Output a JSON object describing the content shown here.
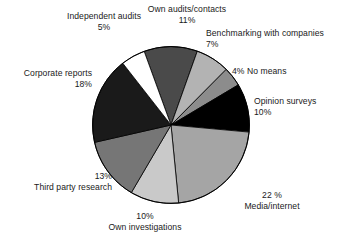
{
  "chart_data": {
    "type": "pie",
    "title": "",
    "subtitle": "",
    "legend": "none",
    "labels_position": "outside-callout",
    "categories": [
      "Own audits/contacts",
      "Benchmarking with companies",
      "No means",
      "Opinion surveys",
      "Media/internet",
      "Own investigations",
      "Third party research",
      "Corporate reports",
      "Independent audits"
    ],
    "values": [
      11,
      7,
      4,
      10,
      22,
      10,
      13,
      18,
      5
    ],
    "value_suffix": "%",
    "total": 100,
    "start_angle_deg": -20,
    "direction": "clockwise",
    "colors": [
      "#4a4a4a",
      "#b3b3b3",
      "#8c8c8c",
      "#000000",
      "#a5a5a5",
      "#c9c9c9",
      "#767676",
      "#1a1a1a",
      "#ffffff"
    ],
    "slice_border_color": "#000000"
  },
  "slices": [
    {
      "name": "Own audits/contacts",
      "label": "Own audits/contacts",
      "pct": "11%",
      "value": 11,
      "color": "#4a4a4a"
    },
    {
      "name": "Benchmarking with companies",
      "label": "Benchmarking with companies",
      "pct": "7%",
      "value": 7,
      "color": "#b3b3b3"
    },
    {
      "name": "No means",
      "label": "No means",
      "pct": "4%",
      "value": 4,
      "color": "#8c8c8c"
    },
    {
      "name": "Opinion surveys",
      "label": "Opinion surveys",
      "pct": "10%",
      "value": 10,
      "color": "#000000"
    },
    {
      "name": "Media/internet",
      "label": "Media/internet",
      "pct": "22 %",
      "value": 22,
      "color": "#a5a5a5"
    },
    {
      "name": "Own investigations",
      "label": "Own investigations",
      "pct": "10%",
      "value": 10,
      "color": "#c9c9c9"
    },
    {
      "name": "Third party research",
      "label": "Third party research",
      "pct": "13%",
      "value": 13,
      "color": "#767676"
    },
    {
      "name": "Corporate reports",
      "label": "Corporate reports",
      "pct": "18%",
      "value": 18,
      "color": "#1a1a1a"
    },
    {
      "name": "Independent audits",
      "label": "Independent audits",
      "pct": "5%",
      "value": 5,
      "color": "#ffffff"
    }
  ],
  "labels": {
    "no_means_inline": "4% No means"
  }
}
